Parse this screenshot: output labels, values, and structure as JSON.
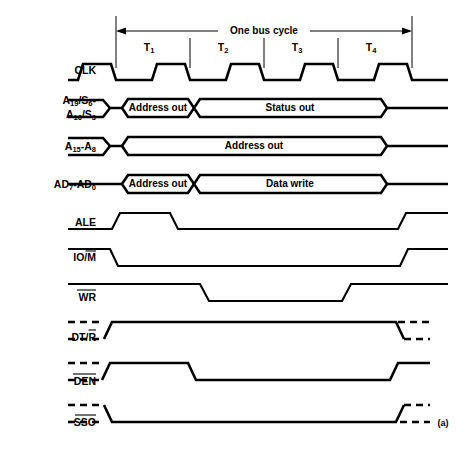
{
  "figure": {
    "caption": "(a)",
    "cycle_annotation": "One bus cycle"
  },
  "tstates": [
    {
      "name": "T",
      "subscript": "1"
    },
    {
      "name": "T",
      "subscript": "2"
    },
    {
      "name": "T",
      "subscript": "3"
    },
    {
      "name": "T",
      "subscript": "4"
    }
  ],
  "signals": [
    {
      "id": "clk",
      "label_line1": "CLK",
      "label_line2": "",
      "type": "clock",
      "bus_segments": []
    },
    {
      "id": "a19-s6",
      "label_line1": "A19/S6-",
      "label_line2": "A16/S3",
      "label_parts_line1": [
        {
          "text": "A",
          "sub": "19"
        },
        {
          "text": "/S",
          "sub": "6"
        },
        {
          "text": "-",
          "sub": ""
        }
      ],
      "label_parts_line2": [
        {
          "text": "A",
          "sub": "16"
        },
        {
          "text": "/S",
          "sub": "3"
        }
      ],
      "type": "bus",
      "bus_segments": [
        "Address out",
        "Status out"
      ]
    },
    {
      "id": "a15-a8",
      "label_line1": "A15-A8",
      "label_line2": "",
      "label_parts_line1": [
        {
          "text": "A",
          "sub": "15"
        },
        {
          "text": "-A",
          "sub": "8"
        }
      ],
      "type": "bus",
      "bus_segments": [
        "Address out"
      ]
    },
    {
      "id": "ad7-ad0",
      "label_line1": "AD7-AD0",
      "label_line2": "",
      "label_parts_line1": [
        {
          "text": "AD",
          "sub": "7"
        },
        {
          "text": "-AD",
          "sub": "0"
        }
      ],
      "type": "bus",
      "bus_segments": [
        "Address out",
        "Data write"
      ]
    },
    {
      "id": "ale",
      "label_line1": "ALE",
      "label_line2": "",
      "overbar": "none",
      "type": "pulse",
      "bus_segments": []
    },
    {
      "id": "io-m",
      "label_line1": "IO/M",
      "label_line2": "",
      "overbar": "partial-M",
      "type": "level",
      "bus_segments": []
    },
    {
      "id": "wr",
      "label_line1": "WR",
      "label_line2": "",
      "overbar": "full",
      "type": "level",
      "bus_segments": []
    },
    {
      "id": "dt-r",
      "label_line1": "DT/R",
      "label_line2": "",
      "overbar": "partial-R",
      "type": "level-tristate",
      "bus_segments": []
    },
    {
      "id": "den",
      "label_line1": "DEN",
      "label_line2": "",
      "overbar": "full",
      "type": "level-tristate",
      "bus_segments": []
    },
    {
      "id": "sso",
      "label_line1": "SSO",
      "label_line2": "",
      "overbar": "full",
      "type": "level-tristate",
      "bus_segments": []
    }
  ],
  "colors": {
    "ink": "#000000",
    "paper": "#ffffff"
  }
}
